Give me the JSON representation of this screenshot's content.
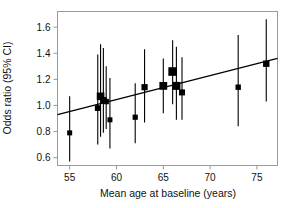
{
  "chart_data": {
    "type": "scatter",
    "title": "",
    "subtitle": "",
    "xlabel": "Mean age at baseline (years)",
    "ylabel": "Odds ratio (95% CI)",
    "xlim": [
      53.7,
      77.2
    ],
    "ylim": [
      0.54,
      1.72
    ],
    "xticks": [
      55,
      60,
      65,
      70,
      75
    ],
    "xticklabels": [
      "55",
      "60",
      "65",
      "70",
      "75"
    ],
    "yticks": [
      0.6,
      0.8,
      1.0,
      1.2,
      1.4,
      1.6
    ],
    "yticklabels": [
      "0.6",
      "0.8",
      "1.0",
      "1.2",
      "1.4",
      "1.6"
    ],
    "grid": false,
    "legend": null,
    "marker": "square",
    "marker_color": "#000000",
    "errorbar_color": "#000000",
    "frame_color": "#9a9a9a",
    "series": [
      {
        "name": "Studies",
        "note": "Marker size is proportional to study weight; vertical bars are 95% confidence intervals.",
        "points": [
          {
            "x": 55.0,
            "y": 0.79,
            "ci_low": 0.57,
            "ci_high": 1.07,
            "size": 5.0
          },
          {
            "x": 58.0,
            "y": 0.98,
            "ci_low": 0.7,
            "ci_high": 1.39,
            "size": 5.8
          },
          {
            "x": 58.3,
            "y": 1.07,
            "ci_low": 0.76,
            "ci_high": 1.47,
            "size": 7.6
          },
          {
            "x": 58.6,
            "y": 1.04,
            "ci_low": 0.79,
            "ci_high": 1.44,
            "size": 6.4
          },
          {
            "x": 58.9,
            "y": 1.03,
            "ci_low": 0.82,
            "ci_high": 1.3,
            "size": 5.4
          },
          {
            "x": 59.3,
            "y": 0.89,
            "ci_low": 0.67,
            "ci_high": 1.21,
            "size": 5.0
          },
          {
            "x": 62.0,
            "y": 0.91,
            "ci_low": 0.71,
            "ci_high": 1.17,
            "size": 5.2
          },
          {
            "x": 63.0,
            "y": 1.14,
            "ci_low": 0.87,
            "ci_high": 1.43,
            "size": 6.2
          },
          {
            "x": 65.0,
            "y": 1.15,
            "ci_low": 0.94,
            "ci_high": 1.36,
            "size": 7.8
          },
          {
            "x": 66.0,
            "y": 1.26,
            "ci_low": 1.01,
            "ci_high": 1.5,
            "size": 8.6
          },
          {
            "x": 66.4,
            "y": 1.15,
            "ci_low": 0.89,
            "ci_high": 1.45,
            "size": 8.0
          },
          {
            "x": 67.0,
            "y": 1.1,
            "ci_low": 0.89,
            "ci_high": 1.37,
            "size": 6.0
          },
          {
            "x": 73.0,
            "y": 1.14,
            "ci_low": 0.84,
            "ci_high": 1.54,
            "size": 5.4
          },
          {
            "x": 76.0,
            "y": 1.32,
            "ci_low": 1.03,
            "ci_high": 1.66,
            "size": 6.4
          }
        ]
      }
    ],
    "trendline": {
      "type": "line",
      "x": [
        53.7,
        77.2
      ],
      "y": [
        0.93,
        1.36
      ],
      "color": "#000000",
      "width": 1.3
    }
  }
}
